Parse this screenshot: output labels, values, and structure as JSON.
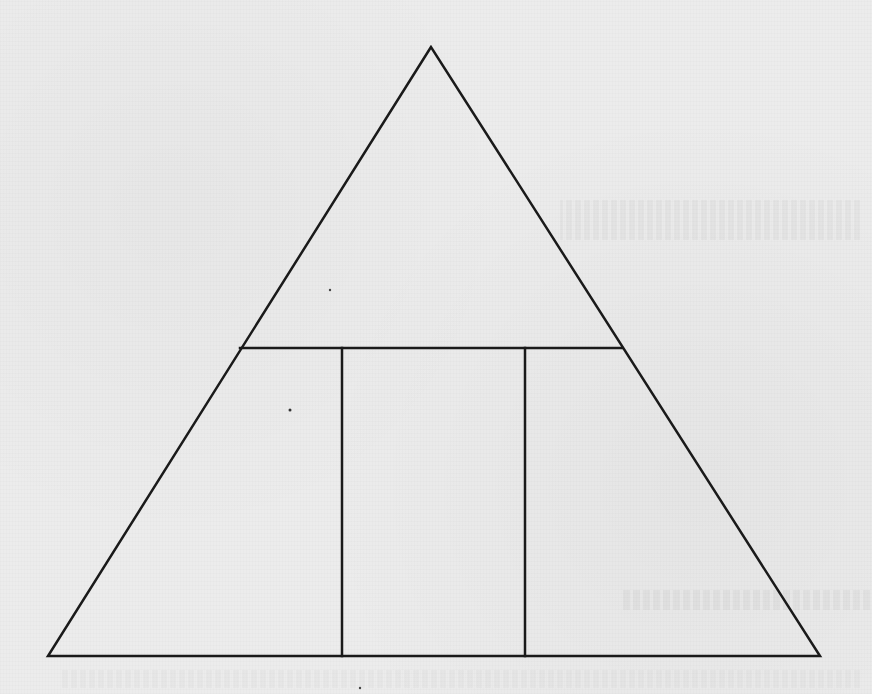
{
  "diagram": {
    "type": "triangle-partition",
    "stroke_color": "#1a1a1a",
    "background_color": "#ececec",
    "stroke_width": 2.5,
    "shapes": {
      "outer_triangle": {
        "apex": [
          431,
          47
        ],
        "bottom_left": [
          48,
          656
        ],
        "bottom_right": [
          820,
          656
        ]
      },
      "horizontal_divider": {
        "y": 348,
        "x_start": 240,
        "x_end": 622
      },
      "vertical_dividers": [
        {
          "x": 342,
          "y_start": 348,
          "y_end": 656
        },
        {
          "x": 525,
          "y_start": 348,
          "y_end": 656
        }
      ]
    },
    "regions": [
      {
        "id": "top-triangle",
        "label": ""
      },
      {
        "id": "bottom-left-region",
        "label": ""
      },
      {
        "id": "bottom-middle-rectangle",
        "label": ""
      },
      {
        "id": "bottom-right-region",
        "label": ""
      }
    ]
  }
}
